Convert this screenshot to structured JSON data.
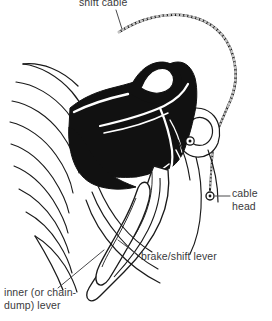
{
  "figure": {
    "background_color": "#ffffff",
    "ink_color": "#1a1a1a",
    "text_color": "#3a3a3c",
    "width": 272,
    "height": 321
  },
  "labels": {
    "shift_cable": "shift cable",
    "cable_head": "cable\nhead",
    "brake_shift_lever": "brake/shift lever",
    "inner_lever": "inner (or chain-\ndump) lever"
  },
  "parts": {
    "handlebar_tape": "handlebar-tape-wrap",
    "lever_body": "lever-body-hood",
    "lever_blade": "brake-shift-lever-blade",
    "inner_lever_blade": "inner-chain-dump-lever",
    "cable": "shift-cable-housing",
    "cable_head_fitting": "cable-head-barrel",
    "pivot_bolt_upper": "upper-pivot-bolt",
    "pivot_bolt_lower": "lower-pivot-bolt"
  }
}
